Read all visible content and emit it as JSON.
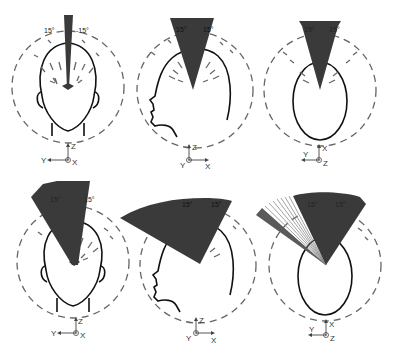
{
  "figure": {
    "panels": [
      {
        "id": "top-front",
        "view": "front",
        "angle_left_label": "15°",
        "angle_right_label": "-15°",
        "axes": {
          "up": "Z",
          "left": "Y",
          "out": "X"
        }
      },
      {
        "id": "top-side",
        "view": "side",
        "angle_left_label": "15°",
        "angle_right_label": "15°",
        "axes": {
          "up": "Z",
          "right": "X",
          "out": "Y"
        }
      },
      {
        "id": "top-top",
        "view": "top",
        "angle_left_label": "15°",
        "angle_right_label": "-15°",
        "axes": {
          "up": "X",
          "left": "Y",
          "out": "Z"
        }
      },
      {
        "id": "bottom-front",
        "view": "front",
        "angle_left_label": "15°",
        "angle_right_label": "15°",
        "axes": {
          "up": "Z",
          "left": "Y",
          "out": "X"
        }
      },
      {
        "id": "bottom-side",
        "view": "side",
        "angle_left_label": "15°",
        "angle_right_label": "15°",
        "axes": {
          "up": "Z",
          "right": "X",
          "out": "Y"
        }
      },
      {
        "id": "bottom-top",
        "view": "top",
        "angle_left_label": "15°",
        "angle_right_label": "15°",
        "axes": {
          "up": "X",
          "left": "Y",
          "out": "Z"
        }
      }
    ],
    "colors": {
      "sector": "#3a3a3a",
      "head_outline": "#111111",
      "dashed_circle": "#666666"
    }
  }
}
